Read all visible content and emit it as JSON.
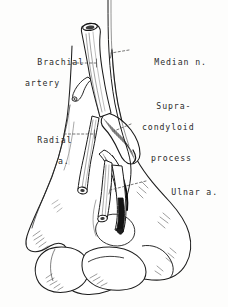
{
  "figure": {
    "style": "pen-and-ink line drawing",
    "background_color": "#fdfdfc",
    "ink_color": "#1a1a1a",
    "label_color": "#2b2b2b"
  },
  "labels": [
    {
      "id": "brachial-artery",
      "line1": "Brachial",
      "line2": "artery",
      "anchor": "brachial artery trunk",
      "leader": "dashed"
    },
    {
      "id": "median-nerve",
      "line1": "Median n.",
      "anchor": "median nerve",
      "leader": "dashed"
    },
    {
      "id": "supracondyloid-process",
      "line1": "Supra-",
      "line2": "condyloid",
      "line3": "process",
      "anchor": "supracondyloid process spur",
      "leader": "dashed"
    },
    {
      "id": "radial-artery",
      "line1": "Radial",
      "line2": "a.",
      "anchor": "radial artery",
      "leader": "dashed"
    },
    {
      "id": "ulnar-artery",
      "line1": "Ulnar a.",
      "anchor": "ulnar artery",
      "leader": "dashed"
    }
  ],
  "structures": [
    {
      "id": "humerus-shaft",
      "name": "humerus shaft"
    },
    {
      "id": "supracondyloid-process",
      "name": "supracondyloid process"
    },
    {
      "id": "medial-epicondyle",
      "name": "medial epicondyle"
    },
    {
      "id": "lateral-epicondyle",
      "name": "lateral epicondyle"
    },
    {
      "id": "capitulum",
      "name": "capitulum"
    },
    {
      "id": "trochlea",
      "name": "trochlea"
    },
    {
      "id": "brachial-artery",
      "name": "brachial artery"
    },
    {
      "id": "median-nerve",
      "name": "median nerve"
    },
    {
      "id": "radial-artery",
      "name": "radial artery"
    },
    {
      "id": "ulnar-artery",
      "name": "ulnar artery"
    }
  ]
}
